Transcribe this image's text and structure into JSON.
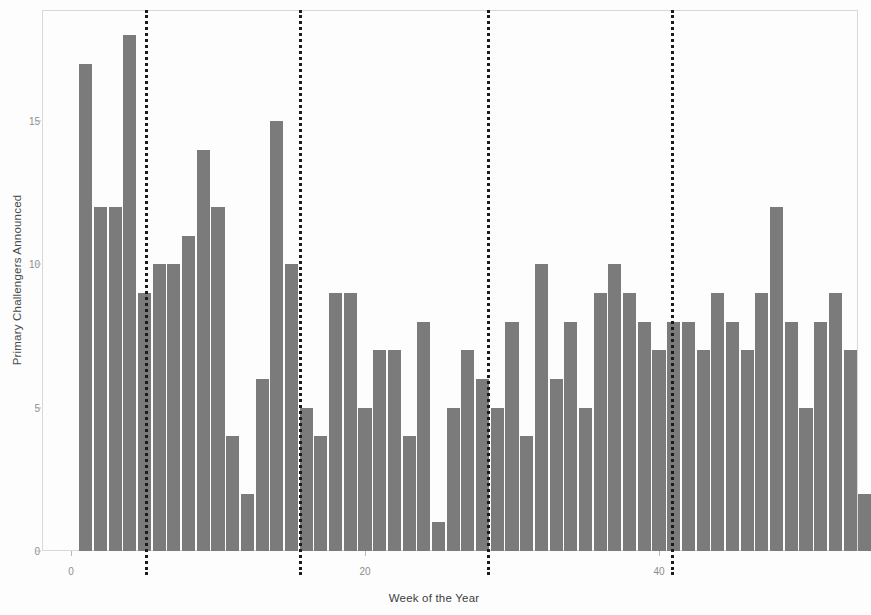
{
  "chart_data": {
    "type": "bar",
    "title": "",
    "xlabel": "Week of the Year",
    "ylabel": "Primary Challengers Announced",
    "xlim": [
      0,
      53
    ],
    "ylim": [
      0,
      18.6
    ],
    "grid": false,
    "legend": null,
    "bar_color": "#7b7b7b",
    "frame_color": "#d8d8d8",
    "reference_line_color": "#1b1b1b",
    "reference_line_style": "dotted",
    "x_ticks": [
      0,
      20,
      40
    ],
    "x_tick_labels": [
      "0",
      "20",
      "40"
    ],
    "y_ticks": [
      0,
      5,
      10,
      15
    ],
    "y_tick_labels": [
      "0",
      "5",
      "10",
      "15"
    ],
    "reference_lines": [
      5,
      15.5,
      28.3,
      40.8
    ],
    "categories": [
      1,
      2,
      3,
      4,
      5,
      6,
      7,
      8,
      9,
      10,
      11,
      12,
      13,
      14,
      15,
      16,
      17,
      18,
      19,
      20,
      21,
      22,
      23,
      24,
      25,
      26,
      27,
      28,
      29,
      30,
      31,
      32,
      33,
      34,
      35,
      36,
      37,
      38,
      39,
      40,
      41,
      42,
      43,
      44,
      45,
      46,
      47,
      48,
      49,
      50,
      51,
      52,
      53,
      54
    ],
    "values": [
      17,
      12,
      12,
      18,
      9,
      10,
      10,
      11,
      14,
      12,
      4,
      2,
      6,
      15,
      10,
      5,
      4,
      9,
      9,
      5,
      7,
      7,
      4,
      8,
      1,
      5,
      7,
      6,
      5,
      8,
      4,
      10,
      6,
      8,
      5,
      9,
      10,
      9,
      8,
      7,
      8,
      8,
      7,
      9,
      8,
      7,
      9,
      12,
      8,
      5,
      8,
      9,
      7,
      2
    ]
  },
  "axes": {
    "y_title": "Primary Challengers Announced",
    "x_title": "Week of the Year"
  }
}
